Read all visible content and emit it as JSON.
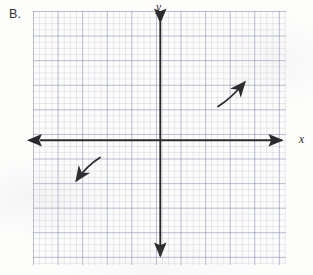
{
  "figure": {
    "problem_label": "B.",
    "background_color": "#fdfdfc",
    "ink_color": "#2a2a2d",
    "grid_line_color": "#787da5",
    "type": "coordinate-plane-graph-paper"
  },
  "axes": {
    "y_label": "y",
    "x_label": "x",
    "origin_px": {
      "x": 160,
      "y": 140
    },
    "x_axis_extent_px": {
      "from": 34,
      "to": 288
    },
    "y_axis_extent_px": {
      "from": 16,
      "to": 262
    },
    "arrowheads": [
      "left",
      "right",
      "up",
      "down"
    ]
  },
  "grid": {
    "left_px": 33,
    "top_px": 11,
    "width_px": 253,
    "height_px": 254,
    "minor_cell_px": 6.15,
    "major_cell_px": 24.6,
    "minor_cells_across": 41,
    "minor_cells_down": 41
  },
  "annotations": {
    "arrows": [
      {
        "name": "upper-right-end-behavior-arrow",
        "quadrant": "I",
        "direction": "up-right",
        "tail_px": {
          "x": 218,
          "y": 106
        },
        "head_px": {
          "x": 248,
          "y": 79
        }
      },
      {
        "name": "lower-left-end-behavior-arrow",
        "quadrant": "III",
        "direction": "down-left",
        "tail_px": {
          "x": 100,
          "y": 157
        },
        "head_px": {
          "x": 73,
          "y": 184
        }
      }
    ]
  }
}
